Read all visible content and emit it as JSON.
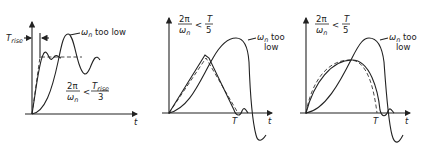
{
  "figure": {
    "panels": [
      {
        "id": "panel-1",
        "y_label_left": "T",
        "y_label_left_sub": "rise",
        "curve_label": [
          "ω",
          "n",
          " too low"
        ],
        "condition": {
          "num": "2π",
          "den": "ω",
          "den_sub": "n",
          "op": "<",
          "rhs_num": "T",
          "rhs_num_sub": "rise",
          "rhs_den": "3"
        },
        "x_axis_label": "t"
      },
      {
        "id": "panel-2",
        "condition": {
          "num": "2π",
          "den": "ω",
          "den_sub": "n",
          "op": "<",
          "rhs_num": "T",
          "rhs_den": "5"
        },
        "curve_label_line1": [
          "ω",
          "n",
          " too"
        ],
        "curve_label_line2": "low",
        "T_marker": "T",
        "x_axis_label": "t"
      },
      {
        "id": "panel-3",
        "condition": {
          "num": "2π",
          "den": "ω",
          "den_sub": "n",
          "op": "<",
          "rhs_num": "T",
          "rhs_den": "5"
        },
        "curve_label_line1": [
          "ω",
          "n",
          " too"
        ],
        "curve_label_line2": "low",
        "T_marker": "T",
        "x_axis_label": "t"
      }
    ]
  }
}
